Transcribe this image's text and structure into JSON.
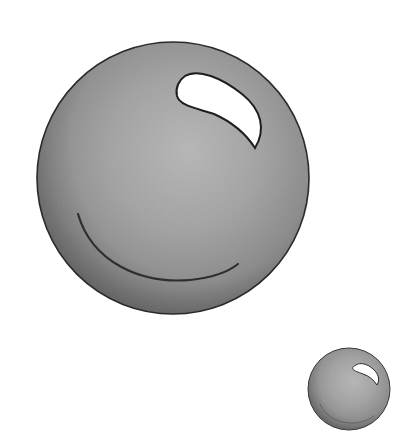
{
  "scene": {
    "description": "Two glossy gray spheres on white background",
    "background": "#ffffff",
    "spheres": [
      {
        "label": "large sphere",
        "cx": 173,
        "cy": 178,
        "r": 136,
        "colors": {
          "light": "#b4b4b4",
          "mid": "#9a9a9a",
          "dark": "#666666",
          "outline": "#2a2a2a"
        }
      },
      {
        "label": "small sphere",
        "cx": 349,
        "cy": 389,
        "r": 41,
        "colors": {
          "light": "#b4b4b4",
          "mid": "#9a9a9a",
          "dark": "#666666",
          "outline": "#333333"
        }
      }
    ]
  }
}
